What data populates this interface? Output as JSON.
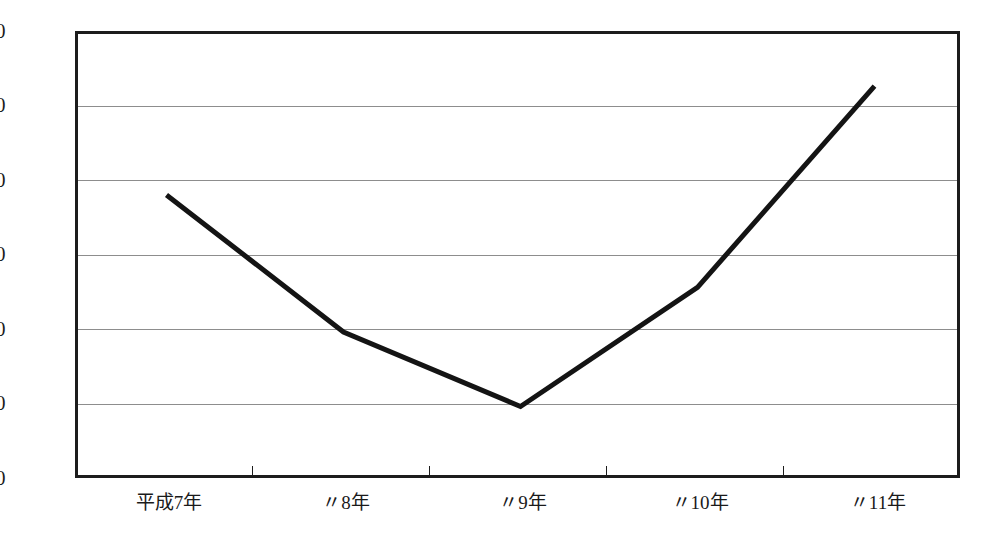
{
  "chart_data": {
    "type": "line",
    "title": "",
    "subtitle": "",
    "xlabel": "",
    "ylabel": "",
    "categories": [
      "平成7年",
      "〃8年",
      "〃9年",
      "〃10年",
      "〃11年"
    ],
    "values": [
      192,
      100,
      50,
      130,
      265
    ],
    "series": [
      {
        "name": "",
        "values": [
          192,
          100,
          50,
          130,
          265
        ]
      }
    ],
    "ylim": [
      0,
      300
    ],
    "y_ticks": [
      0,
      50,
      100,
      150,
      200,
      250,
      300
    ],
    "y_tick_labels": [
      "0",
      "50",
      "100",
      "150",
      "200",
      "250",
      "300"
    ],
    "grid": "horizontal",
    "gridline_values": [
      50,
      100,
      150,
      200,
      250
    ],
    "legend": "none",
    "line_color": "#141414",
    "line_width": 5,
    "markers": "none",
    "frame_color": "#1c1c1c",
    "grid_color": "#8d8d8d",
    "background_color": "#ffffff"
  },
  "axes": {
    "y_labels": [
      "300",
      "250",
      "200",
      "150",
      "100",
      "50",
      "0"
    ],
    "x_labels": [
      "平成7年",
      "〃8年",
      "〃9年",
      "〃10年",
      "〃11年"
    ]
  }
}
